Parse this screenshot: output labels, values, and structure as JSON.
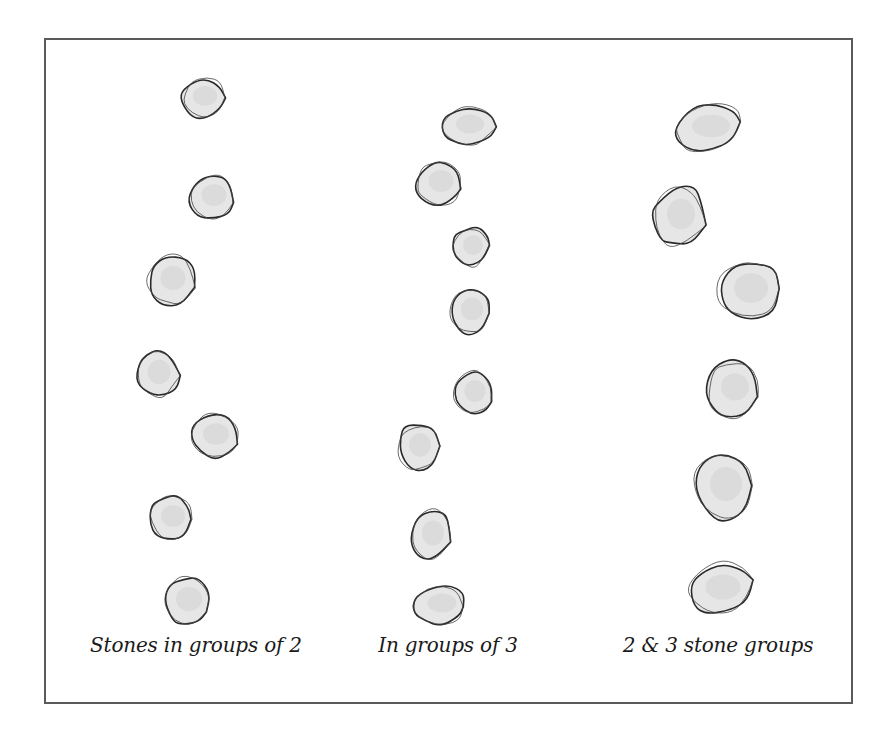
{
  "figure": {
    "frame_color": "#5a5a5a",
    "stone_fill": "#e6e6e6",
    "stone_outline": "#2a2a2a",
    "columns": [
      {
        "id": "groups-of-2",
        "caption": "Stones in groups of 2",
        "caption_x": 196,
        "stones": [
          {
            "cx": 203,
            "cy": 98,
            "rx": 24,
            "ry": 22,
            "rot": -8
          },
          {
            "cx": 212,
            "cy": 197,
            "rx": 25,
            "ry": 24,
            "rot": 5
          },
          {
            "cx": 171,
            "cy": 280,
            "rx": 25,
            "ry": 27,
            "rot": 12
          },
          {
            "cx": 157,
            "cy": 374,
            "rx": 23,
            "ry": 27,
            "rot": -10
          },
          {
            "cx": 214,
            "cy": 436,
            "rx": 26,
            "ry": 24,
            "rot": 8
          },
          {
            "cx": 171,
            "cy": 518,
            "rx": 24,
            "ry": 24,
            "rot": -4
          },
          {
            "cx": 187,
            "cy": 601,
            "rx": 26,
            "ry": 27,
            "rot": 15
          }
        ]
      },
      {
        "id": "groups-of-3",
        "caption": "In groups of 3",
        "caption_x": 448,
        "stones": [
          {
            "cx": 468,
            "cy": 126,
            "rx": 28,
            "ry": 21,
            "rot": -10
          },
          {
            "cx": 439,
            "cy": 183,
            "rx": 25,
            "ry": 24,
            "rot": 5
          },
          {
            "cx": 471,
            "cy": 247,
            "rx": 20,
            "ry": 22,
            "rot": -5
          },
          {
            "cx": 470,
            "cy": 311,
            "rx": 22,
            "ry": 25,
            "rot": 5
          },
          {
            "cx": 473,
            "cy": 393,
            "rx": 21,
            "ry": 24,
            "rot": 10
          },
          {
            "cx": 418,
            "cy": 447,
            "rx": 22,
            "ry": 26,
            "rot": -6
          },
          {
            "cx": 431,
            "cy": 535,
            "rx": 22,
            "ry": 28,
            "rot": 15
          },
          {
            "cx": 440,
            "cy": 605,
            "rx": 29,
            "ry": 21,
            "rot": -8
          }
        ]
      },
      {
        "id": "groups-of-2-and-3",
        "caption": "2 & 3 stone groups",
        "caption_x": 718,
        "stones": [
          {
            "cx": 709,
            "cy": 128,
            "rx": 38,
            "ry": 25,
            "rot": -15
          },
          {
            "cx": 679,
            "cy": 216,
            "rx": 28,
            "ry": 34,
            "rot": 10
          },
          {
            "cx": 749,
            "cy": 290,
            "rx": 34,
            "ry": 33,
            "rot": -5
          },
          {
            "cx": 733,
            "cy": 389,
            "rx": 28,
            "ry": 30,
            "rot": 8
          },
          {
            "cx": 724,
            "cy": 486,
            "rx": 32,
            "ry": 38,
            "rot": -12
          },
          {
            "cx": 721,
            "cy": 589,
            "rx": 35,
            "ry": 28,
            "rot": -20
          }
        ]
      }
    ]
  }
}
